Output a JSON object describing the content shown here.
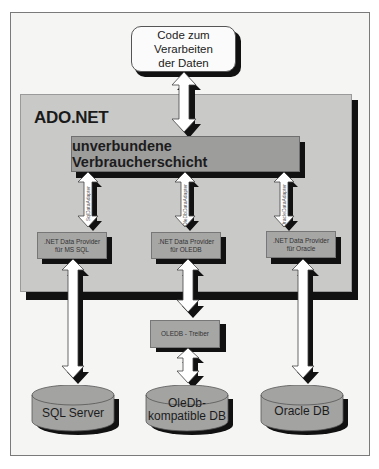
{
  "diagram": {
    "top_box": {
      "lines": [
        "Code zum",
        "Verarbeiten",
        "der Daten"
      ]
    },
    "container": {
      "title": "ADO.NET"
    },
    "layer": {
      "label": "unverbundene Verbraucherschicht"
    },
    "adapters": [
      {
        "label": "SqlDataAdapter"
      },
      {
        "label": "OleDbDataAdapter"
      },
      {
        "label": "OracleDataAdapter"
      }
    ],
    "providers": [
      {
        "lines": [
          ".NET Data Provider",
          "für MS SQL"
        ]
      },
      {
        "lines": [
          ".NET Data Provider",
          "für OLEDB"
        ]
      },
      {
        "lines": [
          ".NET Data Provider",
          "für Oracle"
        ]
      }
    ],
    "driver": {
      "label": "OLEDB - Treiber"
    },
    "databases": [
      {
        "lines": [
          "SQL Server"
        ]
      },
      {
        "lines": [
          "OleDb-",
          "kompatible DB"
        ]
      },
      {
        "lines": [
          "Oracle DB"
        ]
      }
    ],
    "colors": {
      "frame_bg": "#f5f5f4",
      "container_bg": "#c9c9c8",
      "layer_bg": "#9d9d9c",
      "provider_bg": "#a6a6a5",
      "db_bg": "#a3a3a2",
      "shadow": "#111111"
    }
  }
}
